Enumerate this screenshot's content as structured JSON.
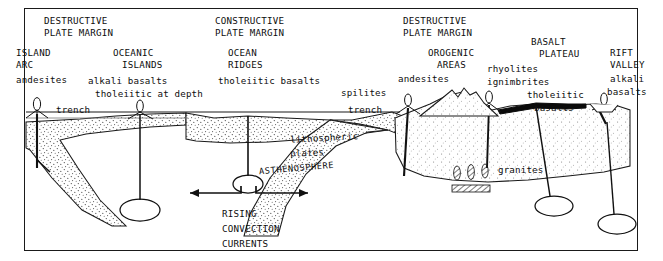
{
  "figure": {
    "border_color": "#1a1a1a",
    "ink_color": "#0d0d0d",
    "stipple_color": "#4a4a4a"
  },
  "margins": [
    {
      "id": "left-destructive",
      "line1": "DESTRUCTIVE",
      "line2": "PLATE MARGIN"
    },
    {
      "id": "constructive",
      "line1": "CONSTRUCTIVE",
      "line2": "PLATE MARGIN"
    },
    {
      "id": "right-destructive",
      "line1": "DESTRUCTIVE",
      "line2": "PLATE MARGIN"
    }
  ],
  "settings": [
    {
      "id": "island-arc",
      "line1": "ISLAND",
      "line2": "ARC",
      "rocks": [
        "andesites"
      ]
    },
    {
      "id": "oceanic-islands",
      "line1": "OCEANIC",
      "line2": "ISLANDS",
      "rocks": [
        "alkali basalts",
        "tholeiitic at depth"
      ]
    },
    {
      "id": "ocean-ridges",
      "line1": "OCEAN",
      "line2": "RIDGES",
      "rocks": [
        "tholeiitic basalts",
        "spilites"
      ]
    },
    {
      "id": "orogenic-areas",
      "line1": "OROGENIC",
      "line2": "AREAS",
      "rocks": [
        "andesites"
      ]
    },
    {
      "id": "basalt-plateau",
      "line1": "BASALT",
      "line2": "PLATEAU",
      "rocks": [
        "rhyolites",
        "ignimbrites",
        "tholeiitic",
        "basalts"
      ]
    },
    {
      "id": "rift-valley",
      "line1": "RIFT",
      "line2": "VALLEY",
      "rocks": [
        "alkali",
        "basalts"
      ]
    }
  ],
  "features": {
    "trench_left": "trench",
    "trench_right": "trench",
    "lithosphere_line1": "lithospheric",
    "lithosphere_line2": "plates",
    "asthenosphere": "ASTHENOSPHERE",
    "granites": "granites",
    "spilites": "spilites"
  },
  "convection": {
    "line1": "RISING",
    "line2": "CONVECTION",
    "line3": "CURRENTS"
  }
}
